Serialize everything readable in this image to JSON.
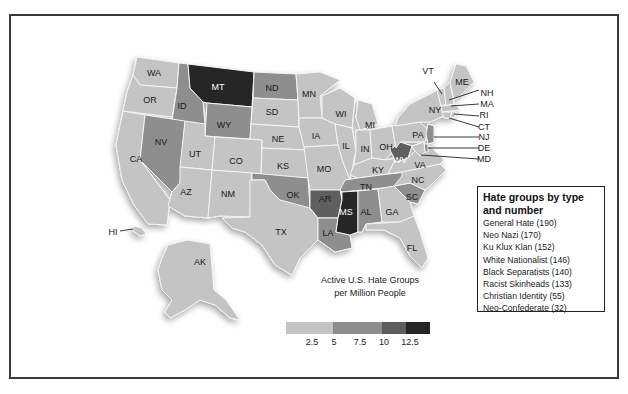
{
  "map": {
    "title": "Active U.S. Hate Groups per Million People",
    "title_line1": "Active U.S. Hate Groups",
    "title_line2": "per Million People",
    "scale": {
      "ticks": [
        "2.5",
        "5",
        "7.5",
        "10",
        "12.5"
      ],
      "bins": [
        {
          "range": "0-5",
          "color": "#c4c4c4"
        },
        {
          "range": "5-10",
          "color": "#8e8e8e"
        },
        {
          "range": "10-12.5",
          "color": "#5e5e5e"
        },
        {
          "range": "12.5+",
          "color": "#262626"
        }
      ]
    },
    "states": [
      {
        "abbr": "WA",
        "shade": "light"
      },
      {
        "abbr": "OR",
        "shade": "light"
      },
      {
        "abbr": "CA",
        "shade": "light"
      },
      {
        "abbr": "ID",
        "shade": "medium"
      },
      {
        "abbr": "NV",
        "shade": "medium"
      },
      {
        "abbr": "MT",
        "shade": "darkest"
      },
      {
        "abbr": "WY",
        "shade": "medium"
      },
      {
        "abbr": "UT",
        "shade": "light"
      },
      {
        "abbr": "AZ",
        "shade": "light"
      },
      {
        "abbr": "CO",
        "shade": "light"
      },
      {
        "abbr": "NM",
        "shade": "light"
      },
      {
        "abbr": "ND",
        "shade": "medium"
      },
      {
        "abbr": "SD",
        "shade": "light"
      },
      {
        "abbr": "NE",
        "shade": "light"
      },
      {
        "abbr": "KS",
        "shade": "light"
      },
      {
        "abbr": "OK",
        "shade": "medium"
      },
      {
        "abbr": "TX",
        "shade": "light"
      },
      {
        "abbr": "MN",
        "shade": "light"
      },
      {
        "abbr": "IA",
        "shade": "light"
      },
      {
        "abbr": "MO",
        "shade": "light"
      },
      {
        "abbr": "AR",
        "shade": "dark"
      },
      {
        "abbr": "LA",
        "shade": "medium"
      },
      {
        "abbr": "WI",
        "shade": "light"
      },
      {
        "abbr": "IL",
        "shade": "light"
      },
      {
        "abbr": "MI",
        "shade": "light"
      },
      {
        "abbr": "IN",
        "shade": "light"
      },
      {
        "abbr": "OH",
        "shade": "light"
      },
      {
        "abbr": "KY",
        "shade": "light"
      },
      {
        "abbr": "TN",
        "shade": "medium"
      },
      {
        "abbr": "MS",
        "shade": "darkest"
      },
      {
        "abbr": "AL",
        "shade": "medium"
      },
      {
        "abbr": "GA",
        "shade": "light"
      },
      {
        "abbr": "FL",
        "shade": "light"
      },
      {
        "abbr": "SC",
        "shade": "medium"
      },
      {
        "abbr": "NC",
        "shade": "light"
      },
      {
        "abbr": "VA",
        "shade": "light"
      },
      {
        "abbr": "WV",
        "shade": "dark"
      },
      {
        "abbr": "PA",
        "shade": "light"
      },
      {
        "abbr": "NY",
        "shade": "light"
      },
      {
        "abbr": "VT",
        "shade": "light"
      },
      {
        "abbr": "NH",
        "shade": "light"
      },
      {
        "abbr": "ME",
        "shade": "light"
      },
      {
        "abbr": "MA",
        "shade": "light"
      },
      {
        "abbr": "RI",
        "shade": "light"
      },
      {
        "abbr": "CT",
        "shade": "light"
      },
      {
        "abbr": "NJ",
        "shade": "medium"
      },
      {
        "abbr": "DE",
        "shade": "medium"
      },
      {
        "abbr": "MD",
        "shade": "light"
      },
      {
        "abbr": "AK",
        "shade": "light"
      },
      {
        "abbr": "HI",
        "shade": "light"
      }
    ]
  },
  "legend": {
    "title_line1": "Hate groups by type",
    "title_line2": "and number",
    "items": [
      "General Hate (190)",
      "Neo Nazi (170)",
      "Ku Klux Klan (152)",
      "White Nationalist (146)",
      "Black Separatists (140)",
      "Racist Skinheads (133)",
      "Christian Identity (55)",
      "Neo-Confederate (32)"
    ]
  },
  "colors": {
    "light": "#c4c4c4",
    "medium": "#8e8e8e",
    "dark": "#5e5e5e",
    "darkest": "#262626",
    "frame": "#3a3a3a"
  },
  "labels": {
    "WA": "WA",
    "OR": "OR",
    "CA": "CA",
    "ID": "ID",
    "NV": "NV",
    "MT": "MT",
    "WY": "WY",
    "UT": "UT",
    "AZ": "AZ",
    "CO": "CO",
    "NM": "NM",
    "ND": "ND",
    "SD": "SD",
    "NE": "NE",
    "KS": "KS",
    "OK": "OK",
    "TX": "TX",
    "MN": "MN",
    "IA": "IA",
    "MO": "MO",
    "AR": "AR",
    "LA": "LA",
    "WI": "WI",
    "IL": "IL",
    "MI": "MI",
    "IN": "IN",
    "OH": "OH",
    "KY": "KY",
    "TN": "TN",
    "MS": "MS",
    "AL": "AL",
    "GA": "GA",
    "FL": "FL",
    "SC": "SC",
    "NC": "NC",
    "VA": "VA",
    "WV": "WV",
    "PA": "PA",
    "NY": "NY",
    "VT": "VT",
    "NH": "NH",
    "ME": "ME",
    "MA": "MA",
    "RI": "RI",
    "CT": "CT",
    "NJ": "NJ",
    "DE": "DE",
    "MD": "MD",
    "AK": "AK",
    "HI": "HI"
  }
}
